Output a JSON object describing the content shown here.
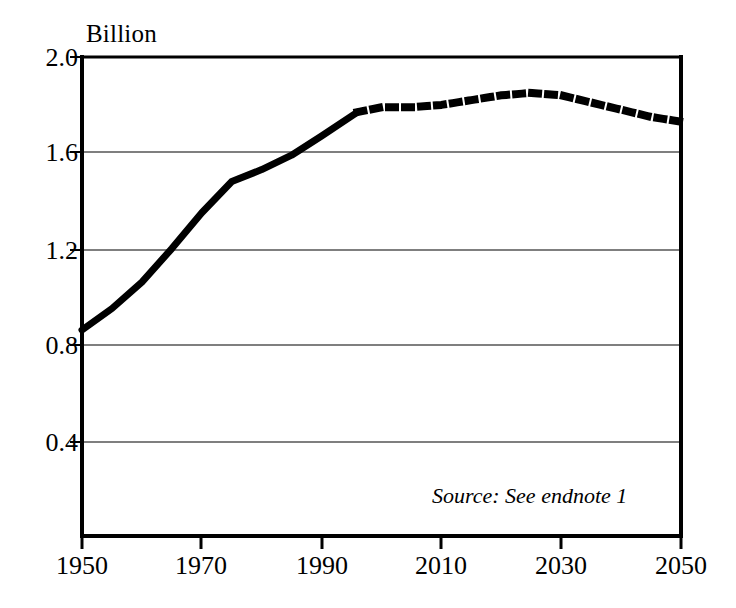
{
  "chart_data": {
    "type": "line",
    "title": "",
    "subtitle": "",
    "unit_label": "Billion",
    "xlabel": "",
    "ylabel": "",
    "xlim": [
      1950,
      2050
    ],
    "ylim": [
      0.0,
      2.0
    ],
    "yticks": [
      "2.0",
      "1.6",
      "1.2",
      "0.8",
      "0.4"
    ],
    "ytick_values": [
      2.0,
      1.6,
      1.2,
      0.8,
      0.4
    ],
    "xticks": [
      "1950",
      "1970",
      "1990",
      "2010",
      "2030",
      "2050"
    ],
    "xtick_values": [
      1950,
      1970,
      1990,
      2010,
      2030,
      2050
    ],
    "grid": "horizontal",
    "legend": "none",
    "annotations": [
      "Source: See endnote 1"
    ],
    "series": [
      {
        "name": "Historical",
        "style": "solid",
        "color": "#000000",
        "x": [
          1950,
          1955,
          1960,
          1965,
          1970,
          1975,
          1980,
          1985,
          1990,
          1996
        ],
        "values": [
          0.86,
          0.95,
          1.06,
          1.2,
          1.35,
          1.48,
          1.53,
          1.59,
          1.67,
          1.77
        ]
      },
      {
        "name": "Projected",
        "style": "dotted",
        "color": "#000000",
        "x": [
          1996,
          2000,
          2005,
          2010,
          2015,
          2020,
          2025,
          2030,
          2035,
          2040,
          2045,
          2050
        ],
        "values": [
          1.77,
          1.79,
          1.79,
          1.8,
          1.82,
          1.84,
          1.85,
          1.84,
          1.81,
          1.78,
          1.75,
          1.73
        ]
      }
    ]
  },
  "labels": {
    "unit": "Billion",
    "source": "Source: See endnote 1"
  }
}
